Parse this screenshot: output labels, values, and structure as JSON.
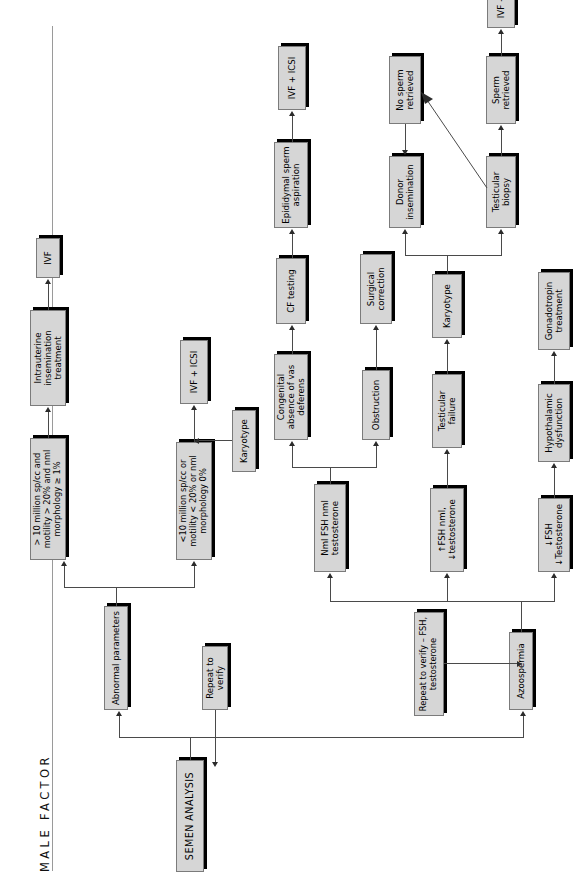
{
  "figure": {
    "title": "MALE FACTOR",
    "orientation": "rotated-90-ccw",
    "box_fill": "#d6d6d6",
    "box_border": "#7b7b7b",
    "shadow_color": "#000000",
    "connector_color": "#4a4a4a"
  },
  "nodes": {
    "semen_analysis": "SEMEN ANALYSIS",
    "abnormal_parameters": "Abnormal parameters",
    "repeat_to_verify": "Repeat to verify",
    "good_params": "> 10 million sp/cc and motility > 20% and nml morphology ≥ 1%",
    "poor_params": "<10 million sp/cc or motility < 20% or nml morphology 0%",
    "iui_treatment": "Intrauterine insemination treatment",
    "ivf": "IVF",
    "karyotype_semen": "Karyotype",
    "ivf_icsi_semen": "IVF + ICSI",
    "azoospermia": "Azoospermia",
    "repeat_verify_fsh": "Repeat to verify – FSH, testosterone",
    "nml_fsh": "Nml FSH nml testosterone",
    "high_fsh": "↑FSH nml, ↓testosterone",
    "low_fsh": "↓FSH ↓Testosterone",
    "congenital_absence": "Congenital absence of vas deferens",
    "cf_testing": "CF testing",
    "epididymal_aspiration": "Epididymal sperm aspiration",
    "ivf_icsi_epid": "IVF + ICSI",
    "obstruction": "Obstruction",
    "surgical_correction": "Surgical correction",
    "testicular_failure": "Testicular failure",
    "karyotype_testicular": "Karyotype",
    "donor_insemination": "Donor insemination",
    "testicular_biopsy": "Testicular biopsy",
    "no_sperm_retrieved": "No sperm retrieved",
    "sperm_retrieved": "Sperm retrieved",
    "ivf_icsi_biopsy": "IVF + ICSI",
    "hypothalamic": "Hypothalamic dysfunction",
    "gonadotropin": "Gonadotropin treatment"
  }
}
